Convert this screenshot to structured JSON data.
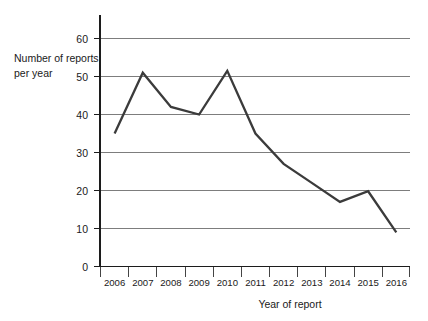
{
  "chart_data": {
    "type": "line",
    "title": "",
    "xlabel": "Year of report",
    "ylabel": "Number of reports per year",
    "ylabel_line1": "Number of reports",
    "ylabel_line2": "per year",
    "categories": [
      "2006",
      "2007",
      "2008",
      "2009",
      "2010",
      "2011",
      "2012",
      "2013",
      "2014",
      "2015",
      "2016"
    ],
    "x": [
      2006,
      2007,
      2008,
      2009,
      2010,
      2011,
      2012,
      2013,
      2014,
      2015,
      2016
    ],
    "values": [
      35,
      51,
      42,
      40,
      51.5,
      35,
      27,
      22,
      17,
      19.8,
      9
    ],
    "series": [
      {
        "name": "Number of reports per year",
        "values": [
          35,
          51,
          42,
          40,
          51.5,
          35,
          27,
          22,
          17,
          19.8,
          9
        ],
        "color": "#3b3b3b"
      }
    ],
    "ylim": [
      0,
      65
    ],
    "xlim": [
      2005.5,
      2016.5
    ],
    "yticks": [
      0,
      10,
      20,
      30,
      40,
      50,
      60
    ],
    "ytick_labels": [
      "0",
      "10",
      "20",
      "30",
      "40",
      "50",
      "60"
    ],
    "grid": true,
    "grid_axis": "y",
    "legend": false,
    "legend_position": "none",
    "line_color": "#3b3b3b",
    "grid_color": "#6f6f6f",
    "axis_color": "#1c1c1c",
    "background": "#ffffff"
  }
}
